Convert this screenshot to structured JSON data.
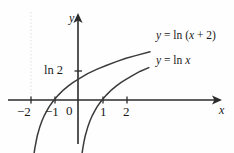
{
  "chart_data": {
    "type": "line",
    "title": "",
    "xlabel": "x",
    "ylabel": "y",
    "xlim": [
      -2.6,
      3.2
    ],
    "ylim": [
      -2.1,
      1.9
    ],
    "grid": false,
    "legend_position": "inline-right",
    "x_ticks": [
      -2,
      -1,
      1,
      2
    ],
    "x_tick_labels": [
      "−2",
      "−1",
      "1",
      "2"
    ],
    "y_ticks": [],
    "y_tick_labels": [],
    "origin_label": "0",
    "annotations": [
      {
        "text": "ln 2",
        "x": 0,
        "y": 0.693,
        "note": "y-intercept of y = ln (x + 2)"
      }
    ],
    "asymptotes": [
      {
        "type": "vertical",
        "x": -2,
        "style": "dotted",
        "color": "#d8d8d8"
      },
      {
        "type": "vertical",
        "x": 0,
        "style": "solid-axis"
      }
    ],
    "series": [
      {
        "name": "y = ln (x + 2)",
        "label_html": "<i>y</i> = ln (<i>x</i> + 2)",
        "color": "#3b3b3b",
        "x_root": -1,
        "y_intercept": 0.693,
        "domain": [
          -1.93,
          3.0
        ],
        "points": [
          [
            -1.93,
            -2.66
          ],
          [
            -1.9,
            -2.3
          ],
          [
            -1.85,
            -1.9
          ],
          [
            -1.8,
            -1.61
          ],
          [
            -1.7,
            -1.2
          ],
          [
            -1.6,
            -0.92
          ],
          [
            -1.5,
            -0.69
          ],
          [
            -1.4,
            -0.51
          ],
          [
            -1.3,
            -0.36
          ],
          [
            -1.2,
            -0.22
          ],
          [
            -1.1,
            -0.11
          ],
          [
            -1.0,
            0.0
          ],
          [
            -0.8,
            0.18
          ],
          [
            -0.6,
            0.34
          ],
          [
            -0.4,
            0.47
          ],
          [
            -0.2,
            0.59
          ],
          [
            0.0,
            0.69
          ],
          [
            0.4,
            0.88
          ],
          [
            0.8,
            1.03
          ],
          [
            1.2,
            1.16
          ],
          [
            1.6,
            1.28
          ],
          [
            2.0,
            1.39
          ],
          [
            2.4,
            1.48
          ],
          [
            3.0,
            1.61
          ]
        ]
      },
      {
        "name": "y = ln x",
        "label_html": "<i>y</i> = ln <i>x</i>",
        "color": "#3b3b3b",
        "x_root": 1,
        "domain": [
          0.07,
          2.95
        ],
        "points": [
          [
            0.07,
            -2.66
          ],
          [
            0.09,
            -2.41
          ],
          [
            0.12,
            -2.12
          ],
          [
            0.16,
            -1.83
          ],
          [
            0.2,
            -1.61
          ],
          [
            0.25,
            -1.39
          ],
          [
            0.3,
            -1.2
          ],
          [
            0.4,
            -0.92
          ],
          [
            0.5,
            -0.69
          ],
          [
            0.6,
            -0.51
          ],
          [
            0.7,
            -0.36
          ],
          [
            0.8,
            -0.22
          ],
          [
            0.9,
            -0.11
          ],
          [
            1.0,
            0.0
          ],
          [
            1.2,
            0.18
          ],
          [
            1.4,
            0.34
          ],
          [
            1.6,
            0.47
          ],
          [
            1.8,
            0.59
          ],
          [
            2.0,
            0.69
          ],
          [
            2.3,
            0.83
          ],
          [
            2.6,
            0.96
          ],
          [
            2.95,
            1.08
          ]
        ]
      }
    ]
  },
  "figure": {
    "x_axis_name": "x",
    "y_axis_name": "y",
    "origin_label": "0",
    "tick_minus_two": "−2",
    "tick_minus_one": "−1",
    "tick_one": "1",
    "tick_two": "2",
    "intercept_label": "ln 2",
    "curve_label_upper": "y = ln (x + 2)",
    "curve_label_lower": "y = ln x"
  },
  "colors": {
    "curve": "#3b3b3b",
    "axis": "#2b2b2b",
    "asymptote": "#dcdcdc",
    "text": "#1a1a1a",
    "background": "#fefefe"
  }
}
